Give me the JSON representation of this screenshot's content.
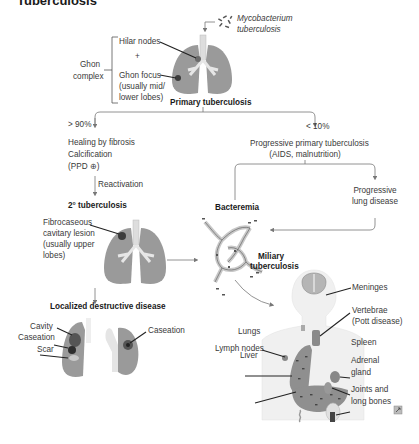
{
  "title": "Tuberculosis",
  "organism": {
    "line1": "Mycobacterium",
    "line2": "tuberculosis"
  },
  "ghon": {
    "complex_line1": "Ghon",
    "complex_line2": "complex",
    "hilar": "Hilar nodes",
    "plus": "+",
    "focus_line1": "Ghon focus",
    "focus_line2": "(usually mid/",
    "focus_line3": "lower lobes)"
  },
  "primary": "Primary tuberculosis",
  "left_branch": {
    "percent": "> 90%",
    "line1": "Healing by fibrosis",
    "line2": "Calcification",
    "line3": "(PPD ⊕)",
    "reactivation": "Reactivation"
  },
  "right_branch": {
    "percent": "< 10%",
    "line1": "Progressive primary tuberculosis",
    "line2": "(AIDS, malnutrition)",
    "progressive_line1": "Progressive",
    "progressive_line2": "lung disease"
  },
  "secondary": {
    "title": "2° tuberculosis",
    "lesion_line1": "Fibrocaseous",
    "lesion_line2": "cavitary lesion",
    "lesion_line3": "(usually upper",
    "lesion_line4": "lobes)"
  },
  "localized": {
    "title": "Localized destructive disease",
    "cavity": "Cavity",
    "caseation_left": "Caseation",
    "scar": "Scar",
    "caseation_right": "Caseation"
  },
  "bacteremia": "Bacteremia",
  "miliary": {
    "line1": "Miliary",
    "line2": "tuberculosis"
  },
  "sites": {
    "meninges": "Meninges",
    "vertebrae_line1": "Vertebrae",
    "vertebrae_line2": "(Pott disease)",
    "lymph": "Lymph nodes",
    "lungs": "Lungs",
    "liver": "Liver",
    "spleen": "Spleen",
    "adrenal_line1": "Adrenal",
    "adrenal_line2": "gland",
    "joints_line1": "Joints and",
    "joints_line2": "long bones"
  },
  "colors": {
    "lung": "#8f8f8f",
    "lesion": "#3c3c3c",
    "line": "#555555",
    "body": "#efefef"
  }
}
